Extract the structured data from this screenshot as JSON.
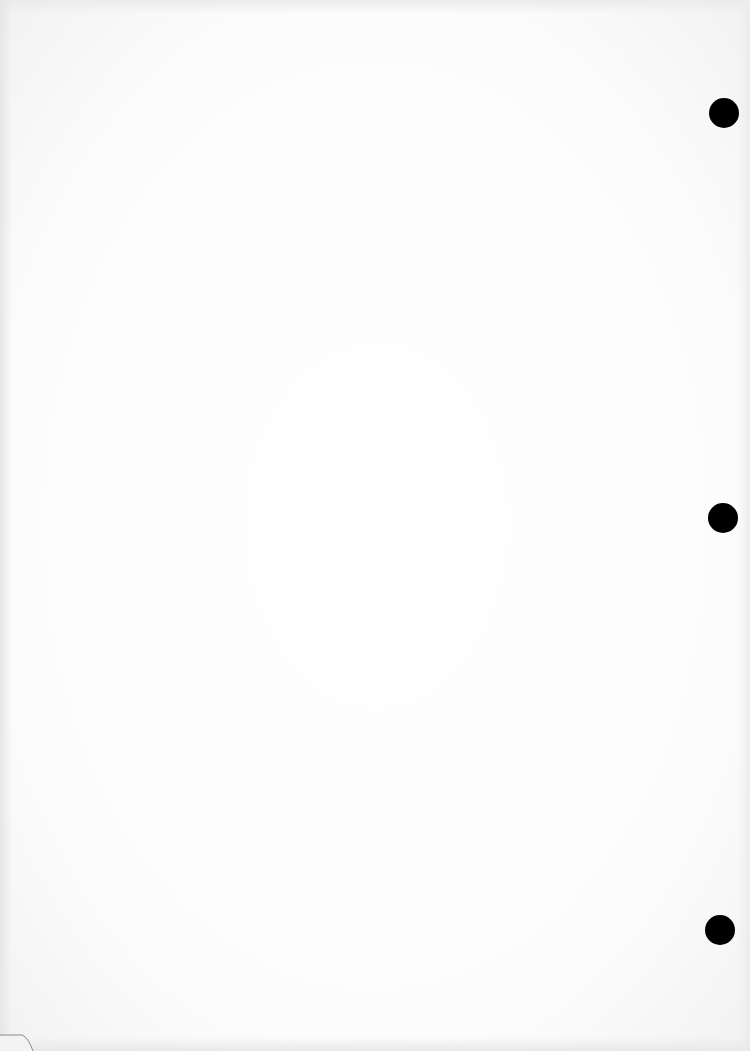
{
  "document": {
    "type": "blank scanned page",
    "text": "",
    "background_color": "#fdfdfd"
  },
  "punch_holes": [
    {
      "cx": 724,
      "cy": 113,
      "diameter": 30,
      "color": "#000000"
    },
    {
      "cx": 723,
      "cy": 518,
      "diameter": 30,
      "color": "#000000"
    },
    {
      "cx": 720,
      "cy": 930,
      "diameter": 30,
      "color": "#000000"
    }
  ],
  "corner_fold": {
    "position": "bottom-left",
    "color": "#888888"
  }
}
